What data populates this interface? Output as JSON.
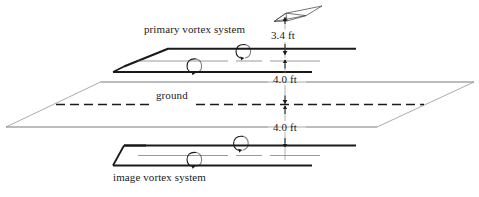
{
  "figure": {
    "labels": {
      "primary_vortex": "primary vortex system",
      "image_vortex": "image vortex system",
      "ground": "ground",
      "height_wing": "3.4 ft",
      "height_upper": "4.0 ft",
      "height_lower": "4.0 ft"
    },
    "dimensions": [
      {
        "name": "wing-height-above-upper-vortex",
        "value": 3.4,
        "unit": "ft",
        "label": "3.4 ft"
      },
      {
        "name": "upper-vortex-above-ground",
        "value": 4.0,
        "unit": "ft",
        "label": "4.0 ft"
      },
      {
        "name": "ground-to-image-vortex",
        "value": 4.0,
        "unit": "ft",
        "label": "4.0 ft"
      }
    ],
    "colors": {
      "stroke": "#1a1a1a",
      "thin_stroke": "#6e6e6e",
      "ground_stroke": "#8a8a8a",
      "background": "#ffffff"
    },
    "elements": {
      "aircraft": "wing-planform-icon",
      "vortex_swirl_primary_upper": "vortex-swirl-icon",
      "vortex_swirl_primary_lower": "vortex-swirl-icon",
      "vortex_swirl_image_upper": "vortex-swirl-icon",
      "vortex_swirl_image_lower": "vortex-swirl-icon",
      "ground_plane": "ground-plane-parallelogram",
      "ground_centerline": "ground-dashed-centerline"
    }
  }
}
